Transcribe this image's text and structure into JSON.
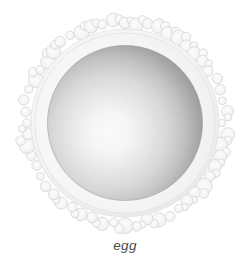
{
  "figure": {
    "caption": "egg",
    "subject_name": "egg",
    "background_color": "#ffffff",
    "caption_color": "#4a4a4a"
  },
  "illustration": {
    "type": "biological-diagram",
    "outer_layer": {
      "name": "corona-radiata",
      "description": "scalloped bumpy outer ring of follicular cells",
      "fill_color": "#f2f2f2",
      "stroke_color": "#cfcfcf",
      "lobe_count": 56,
      "center_x": 125,
      "center_y": 123,
      "outer_radius": 103,
      "inner_radius": 93,
      "lobe_radius": 6
    },
    "zona_pellucida": {
      "name": "zona-pellucida",
      "description": "pale translucent band between corona and ovum",
      "fill_color": "#f7f7f7",
      "radius": 93
    },
    "ovum": {
      "name": "ovum-body",
      "description": "shaded spherical cell body with radial gradient",
      "radius": 77,
      "center_x": 125,
      "center_y": 123,
      "highlight_x_pct": 40,
      "highlight_y_pct": 56,
      "highlight_color": "#fdfdfd",
      "mid_color": "#d8d8d8",
      "edge_color": "#9a9a9a",
      "rim_color": "#8d8d8d"
    }
  },
  "canvas": {
    "width": 250,
    "height": 273
  }
}
